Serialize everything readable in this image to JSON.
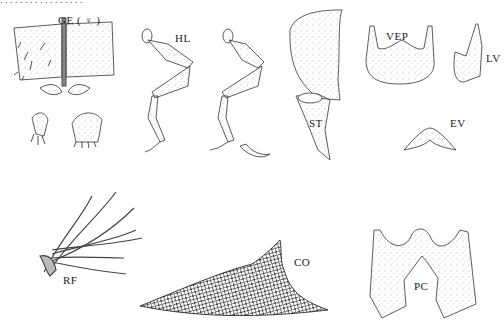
{
  "figure": {
    "top_caption_cut": ". . . . . . . . . . . . . . . . .",
    "labels": {
      "ge": "GE ( ♀ )",
      "hl": "HL",
      "st": "ST",
      "vep": "VEP",
      "lv": "LV",
      "ev": "EV",
      "rf": "RF",
      "co": "CO",
      "pc": "PC"
    },
    "colors": {
      "ink": "#333333",
      "stipple": "#9a9a9a",
      "background": "#ffffff"
    }
  }
}
